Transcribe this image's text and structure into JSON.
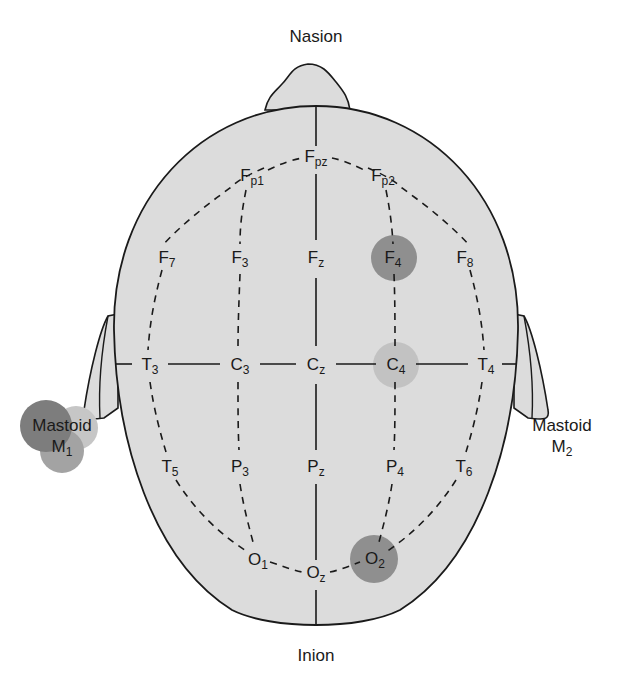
{
  "figure": {
    "landmarks": {
      "nasion": "Nasion",
      "inion": "Inion",
      "mastoid_left": {
        "word": "Mastoid",
        "main": "M",
        "sub": "1"
      },
      "mastoid_right": {
        "word": "Mastoid",
        "main": "M",
        "sub": "2"
      }
    },
    "electrodes": [
      {
        "id": "Fpz",
        "main": "F",
        "sub": "pz",
        "x": 316,
        "y": 158,
        "highlight": null
      },
      {
        "id": "Fp1",
        "main": "F",
        "sub": "p1",
        "x": 249,
        "y": 177,
        "highlight": null
      },
      {
        "id": "Fp2",
        "main": "F",
        "sub": "p2",
        "x": 383,
        "y": 177,
        "highlight": null
      },
      {
        "id": "F7",
        "main": "F",
        "sub": "7",
        "x": 167,
        "y": 257,
        "highlight": null
      },
      {
        "id": "F3",
        "main": "F",
        "sub": "3",
        "x": 240,
        "y": 257,
        "highlight": null
      },
      {
        "id": "Fz",
        "main": "F",
        "sub": "z",
        "x": 316,
        "y": 257,
        "highlight": null
      },
      {
        "id": "F4",
        "main": "F",
        "sub": "4",
        "x": 393,
        "y": 257,
        "highlight": "dark"
      },
      {
        "id": "F8",
        "main": "F",
        "sub": "8",
        "x": 465,
        "y": 257,
        "highlight": null
      },
      {
        "id": "T3",
        "main": "T",
        "sub": "3",
        "x": 146,
        "y": 364,
        "highlight": null
      },
      {
        "id": "C3",
        "main": "C",
        "sub": "3",
        "x": 238,
        "y": 364,
        "highlight": null
      },
      {
        "id": "Cz",
        "main": "C",
        "sub": "z",
        "x": 316,
        "y": 364,
        "highlight": null
      },
      {
        "id": "C4",
        "main": "C",
        "sub": "4",
        "x": 395,
        "y": 364,
        "highlight": "light"
      },
      {
        "id": "T4",
        "main": "T",
        "sub": "4",
        "x": 487,
        "y": 364,
        "highlight": null
      },
      {
        "id": "T5",
        "main": "T",
        "sub": "5",
        "x": 169,
        "y": 466,
        "highlight": null
      },
      {
        "id": "P3",
        "main": "P",
        "sub": "3",
        "x": 239,
        "y": 466,
        "highlight": null
      },
      {
        "id": "Pz",
        "main": "P",
        "sub": "z",
        "x": 316,
        "y": 466,
        "highlight": null
      },
      {
        "id": "P4",
        "main": "P",
        "sub": "4",
        "x": 394,
        "y": 466,
        "highlight": null
      },
      {
        "id": "T6",
        "main": "T",
        "sub": "6",
        "x": 464,
        "y": 466,
        "highlight": null
      },
      {
        "id": "O1",
        "main": "O",
        "sub": "1",
        "x": 256,
        "y": 560,
        "highlight": null
      },
      {
        "id": "Oz",
        "main": "O",
        "sub": "z",
        "x": 316,
        "y": 574,
        "highlight": null
      },
      {
        "id": "O2",
        "main": "O",
        "sub": "2",
        "x": 376,
        "y": 560,
        "highlight": "dark"
      }
    ],
    "colors": {
      "head_fill": "#dcdcdc",
      "outline": "#1a1a1a",
      "highlight_dark": "#8f8f8f",
      "highlight_light": "#c2c2c2",
      "mastoid_dark": "#7d7d7d",
      "mastoid_mid": "#a3a3a3",
      "mastoid_light": "#c6c6c6"
    }
  }
}
